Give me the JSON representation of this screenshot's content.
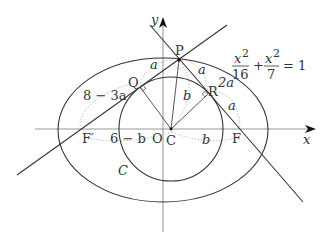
{
  "diagram": {
    "equation": {
      "lhs_num1": "x",
      "lhs_exp1": "2",
      "lhs_den1": "16",
      "plus": "+",
      "lhs_num2": "x",
      "lhs_exp2": "2",
      "lhs_den2": "7",
      "rhs": "= 1"
    },
    "axes": {
      "x_label": "x",
      "y_label": "y"
    },
    "points": {
      "P": "P",
      "Q": "Q",
      "R": "R",
      "F_prime": "F′",
      "F": "F",
      "O": "O",
      "C": "C"
    },
    "segment_labels": {
      "PQ": "a",
      "PR": "a",
      "R_to_ellipse": "2a",
      "R_to_F": "a",
      "Q_to_F_prime": "8 − 3a",
      "PC": "b",
      "F_prime_to_C": "6 − b",
      "C_to_F": "b"
    },
    "curve_label": "C",
    "colors": {
      "line": "#333333",
      "axis": "#888888",
      "dotted": "#aaaaaa",
      "text": "#333333"
    }
  }
}
